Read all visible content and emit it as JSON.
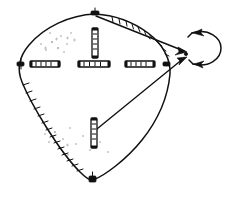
{
  "figure": {
    "title": "Hand-drawn teardrop outline with segmented bars and rotation arrow",
    "type": "line-diagram",
    "caption": "",
    "canvas": {
      "width": 232,
      "height": 198,
      "background": "#ffffff"
    },
    "colors": {
      "ink": "#111111",
      "stipple": "#9a9a9a",
      "paper": "#ffffff"
    }
  },
  "shape": {
    "name": "teardrop-outline",
    "description": "closed egg / teardrop contour, rounded left lobe tapering to a point at right",
    "apex_top": {
      "x": 95,
      "y": 14
    },
    "apex_bottom": {
      "x": 93,
      "y": 180
    },
    "apex_right": {
      "x": 170,
      "y": 55
    },
    "left_extent": {
      "x": 20,
      "y": 65
    }
  },
  "hatching": [
    {
      "name": "lower-left-hatch",
      "side": "lower-left-arc",
      "tick_count": 14,
      "tick_length": 7
    },
    {
      "name": "upper-right-hatch",
      "side": "upper-right-arc",
      "tick_count": 11,
      "tick_length": 6
    }
  ],
  "bars": [
    {
      "name": "bar-left-outer",
      "orientation": "horizontal",
      "x": 30,
      "y": 64,
      "length": 30,
      "thickness": 6,
      "segments": 5
    },
    {
      "name": "bar-center",
      "orientation": "horizontal",
      "x": 78,
      "y": 64,
      "length": 32,
      "thickness": 6,
      "segments": 5
    },
    {
      "name": "bar-right-outer",
      "orientation": "horizontal",
      "x": 125,
      "y": 64,
      "length": 30,
      "thickness": 6,
      "segments": 5
    },
    {
      "name": "bar-upper-vertical",
      "orientation": "vertical",
      "x": 95,
      "y": 28,
      "length": 30,
      "thickness": 6,
      "segments": 5
    },
    {
      "name": "bar-lower-vertical",
      "orientation": "vertical",
      "x": 94,
      "y": 118,
      "length": 30,
      "thickness": 6,
      "segments": 5
    }
  ],
  "pins": [
    {
      "name": "pin-top",
      "x": 95,
      "y": 14
    },
    {
      "name": "pin-bottom",
      "x": 93,
      "y": 180
    },
    {
      "name": "pin-left",
      "x": 21,
      "y": 64
    },
    {
      "name": "pin-right",
      "x": 166,
      "y": 64
    }
  ],
  "leaders": [
    {
      "name": "leader-upper",
      "from": {
        "x": 95,
        "y": 16
      },
      "to": {
        "x": 186,
        "y": 52
      },
      "arrow": "end"
    },
    {
      "name": "leader-lower",
      "from": {
        "x": 92,
        "y": 133
      },
      "to": {
        "x": 186,
        "y": 58
      },
      "arrow": "end"
    }
  ],
  "rotation_arrow": {
    "name": "rotation-arrow",
    "description": "curved double-headed arrow indicating rotation about the right apex",
    "center": {
      "x": 205,
      "y": 47
    },
    "heads": 2,
    "direction": "bidirectional"
  },
  "stipple": {
    "name": "interior-stipple",
    "dot_count": 26,
    "description": "sparse dot and tick shading inside the contour"
  },
  "labels": []
}
